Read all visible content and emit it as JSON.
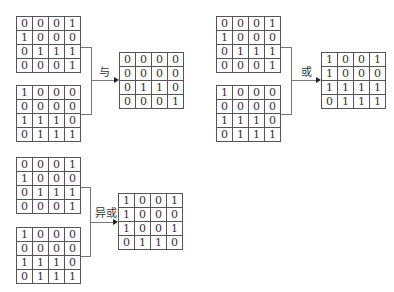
{
  "operations": [
    {
      "label": "与",
      "input_a": [
        [
          0,
          0,
          0,
          1
        ],
        [
          1,
          0,
          0,
          0
        ],
        [
          0,
          1,
          1,
          1
        ],
        [
          0,
          0,
          0,
          1
        ]
      ],
      "input_b": [
        [
          1,
          0,
          0,
          0
        ],
        [
          0,
          0,
          0,
          0
        ],
        [
          1,
          1,
          1,
          0
        ],
        [
          0,
          1,
          1,
          1
        ]
      ],
      "result": [
        [
          0,
          0,
          0,
          0
        ],
        [
          0,
          0,
          0,
          0
        ],
        [
          0,
          1,
          1,
          0
        ],
        [
          0,
          0,
          0,
          1
        ]
      ]
    },
    {
      "label": "或",
      "input_a": [
        [
          0,
          0,
          0,
          1
        ],
        [
          1,
          0,
          0,
          0
        ],
        [
          0,
          1,
          1,
          1
        ],
        [
          0,
          0,
          0,
          1
        ]
      ],
      "input_b": [
        [
          1,
          0,
          0,
          0
        ],
        [
          0,
          0,
          0,
          0
        ],
        [
          1,
          1,
          1,
          0
        ],
        [
          0,
          1,
          1,
          1
        ]
      ],
      "result": [
        [
          1,
          0,
          0,
          1
        ],
        [
          1,
          0,
          0,
          0
        ],
        [
          1,
          1,
          1,
          1
        ],
        [
          0,
          1,
          1,
          1
        ]
      ]
    },
    {
      "label": "异或",
      "input_a": [
        [
          0,
          0,
          0,
          1
        ],
        [
          1,
          0,
          0,
          0
        ],
        [
          0,
          1,
          1,
          1
        ],
        [
          0,
          0,
          0,
          1
        ]
      ],
      "input_b": [
        [
          1,
          0,
          0,
          0
        ],
        [
          0,
          0,
          0,
          0
        ],
        [
          1,
          1,
          1,
          0
        ],
        [
          0,
          1,
          1,
          1
        ]
      ],
      "result": [
        [
          1,
          0,
          0,
          1
        ],
        [
          1,
          0,
          0,
          0
        ],
        [
          1,
          0,
          0,
          1
        ],
        [
          0,
          1,
          1,
          0
        ]
      ]
    }
  ]
}
